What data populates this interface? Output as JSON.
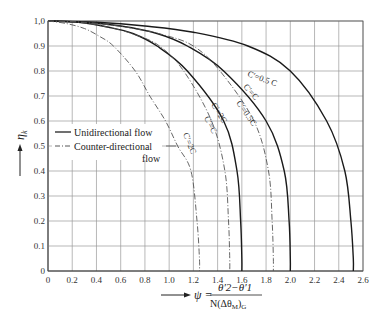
{
  "chart_data": {
    "type": "line",
    "title": "",
    "xlabel": "ψ = (θ′2 − θ′1) / N(Δθ_M)_G",
    "ylabel": "η_k",
    "xlim": [
      0,
      2.6
    ],
    "ylim": [
      0,
      1.0
    ],
    "grid": true,
    "x_ticks": [
      "0",
      "0.2",
      "0.4",
      "0.6",
      "0.8",
      "1.0",
      "1.2",
      "1.4",
      "1.6",
      "1.8",
      "2.0",
      "2.2",
      "2.4",
      "2.6"
    ],
    "y_ticks": [
      "0",
      "0.1",
      "0.2",
      "0.3",
      "0.4",
      "0.5",
      "0.6",
      "0.7",
      "0.8",
      "0.9",
      "1,0"
    ],
    "legend": [
      {
        "label": "Unidirectional flow",
        "style": "solid"
      },
      {
        "label": "Counter-directional flow",
        "style": "dash-dot"
      }
    ],
    "legend_position": "left-middle",
    "series": [
      {
        "name": "Unidirectional C'=0.5C",
        "style": "solid",
        "label": "C'=0.5 C",
        "x": [
          0,
          0.4,
          0.8,
          1.2,
          1.65,
          2.0,
          2.3,
          2.45,
          2.5,
          2.52,
          2.52
        ],
        "y": [
          1.0,
          0.995,
          0.98,
          0.955,
          0.9,
          0.8,
          0.6,
          0.4,
          0.2,
          0.05,
          0
        ]
      },
      {
        "name": "Unidirectional C'=C",
        "style": "solid",
        "label": "C'=C",
        "x": [
          0,
          0.3,
          0.6,
          0.9,
          1.15,
          1.45,
          1.8,
          1.95,
          1.99,
          2.0,
          2.0
        ],
        "y": [
          1.0,
          0.995,
          0.98,
          0.95,
          0.9,
          0.8,
          0.6,
          0.4,
          0.2,
          0.05,
          0
        ]
      },
      {
        "name": "Unidirectional C'=2C",
        "style": "solid",
        "label": "C'=2C",
        "x": [
          0,
          0.25,
          0.5,
          0.7,
          0.9,
          1.15,
          1.45,
          1.56,
          1.59,
          1.6,
          1.6
        ],
        "y": [
          1.0,
          0.995,
          0.975,
          0.95,
          0.9,
          0.8,
          0.6,
          0.4,
          0.2,
          0.05,
          0
        ]
      },
      {
        "name": "Counter-directional C'=0.5C",
        "style": "dash-dot",
        "label": "C'=0.5C",
        "x": [
          0,
          0.3,
          0.65,
          0.95,
          1.2,
          1.42,
          1.7,
          1.82,
          1.85,
          1.86,
          1.86
        ],
        "y": [
          1.0,
          0.995,
          0.975,
          0.945,
          0.9,
          0.8,
          0.6,
          0.4,
          0.2,
          0.05,
          0
        ]
      },
      {
        "name": "Counter-directional C'=C",
        "style": "dash-dot",
        "label": "C'=C",
        "x": [
          0,
          0.25,
          0.5,
          0.72,
          0.92,
          1.12,
          1.35,
          1.46,
          1.49,
          1.5,
          1.5
        ],
        "y": [
          1.0,
          0.995,
          0.975,
          0.945,
          0.9,
          0.8,
          0.6,
          0.4,
          0.2,
          0.05,
          0
        ]
      },
      {
        "name": "Counter-directional C'=2C",
        "style": "dash-dot",
        "label": "C'=2C",
        "x": [
          0,
          0.15,
          0.3,
          0.42,
          0.54,
          0.72,
          0.84,
          0.97,
          1.07,
          1.18,
          1.23,
          1.25,
          1.25
        ],
        "y": [
          1.0,
          0.99,
          0.97,
          0.94,
          0.9,
          0.8,
          0.7,
          0.6,
          0.5,
          0.4,
          0.2,
          0.05,
          0
        ]
      }
    ]
  },
  "labels": {
    "y_axis": "η",
    "y_axis_sub": "k",
    "x_axis_prefix": "ψ =",
    "x_numerator": "θ′2−θ′1",
    "x_denominator": "N(Δθ",
    "x_denominator_sub1": "M",
    "x_denominator_close": ")",
    "x_denominator_sub2": "G",
    "legend_uni": "Unidirectional flow",
    "legend_counter_1": "Counter-directional",
    "legend_counter_2": "flow",
    "curve_uni_05": "C′=0.5 C",
    "curve_uni_1": "C′=C",
    "curve_uni_2": "C′=2C",
    "curve_cnt_05": "C′=0.5C",
    "curve_cnt_1": "C′=C",
    "curve_cnt_2": "C′=2C"
  }
}
